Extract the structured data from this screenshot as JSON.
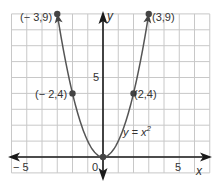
{
  "chart_data": {
    "type": "line",
    "title": "",
    "xlabel": "x",
    "ylabel": "y",
    "xlim": [
      -6,
      7
    ],
    "ylim": [
      -1,
      9
    ],
    "grid": true,
    "legend": null,
    "x_ticks_labeled": [
      "-5",
      "0",
      "5"
    ],
    "y_ticks_labeled": [
      "5"
    ],
    "series": [
      {
        "name": "y = x^2",
        "function": "y = x^2",
        "x": [
          -3,
          -2,
          -1,
          0,
          1,
          2,
          3
        ],
        "y": [
          9,
          4,
          1,
          0,
          1,
          4,
          9
        ]
      }
    ],
    "points": [
      {
        "x": -3,
        "y": 9,
        "label": "(−3,9)"
      },
      {
        "x": -2,
        "y": 4,
        "label": "(−2,4)"
      },
      {
        "x": 0,
        "y": 0,
        "label": ""
      },
      {
        "x": 2,
        "y": 4,
        "label": "(2,4)"
      },
      {
        "x": 3,
        "y": 9,
        "label": "(3,9)"
      }
    ],
    "annotations": [
      "y = x²"
    ]
  },
  "labels": {
    "x_axis": "x",
    "y_axis": "y",
    "tick_neg5": "− 5",
    "tick_0": "0",
    "tick_5x": "5",
    "tick_5y": "5",
    "pt_m3_9": "(− 3,9)",
    "pt_3_9": "(3,9)",
    "pt_m2_4": "(− 2,4)",
    "pt_2_4": "(2,4)",
    "eq_prefix": "y = x",
    "eq_exp": "2"
  },
  "colors": {
    "grid": "#c8c8c8",
    "axis": "#1a1a1a",
    "curve": "#555555",
    "point": "#444444"
  }
}
